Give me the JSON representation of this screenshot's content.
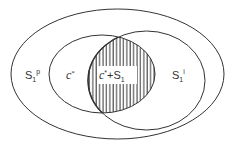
{
  "diagram": {
    "type": "venn",
    "stroke_color": "#333333",
    "hatch_color": "#333333",
    "background": "#ffffff",
    "regions": {
      "outer": {
        "label_base": "S",
        "label_sub": "1",
        "label_sup": "p"
      },
      "middle": {
        "label_base": "c",
        "label_sup": "*"
      },
      "intersection": {
        "label_base": "c",
        "label_sup": "*",
        "label_plus": "+S",
        "label_sub": "1",
        "fill": "vertical-hatch"
      },
      "right": {
        "label_base": "S",
        "label_sub": "1",
        "label_sup": "i"
      }
    }
  }
}
